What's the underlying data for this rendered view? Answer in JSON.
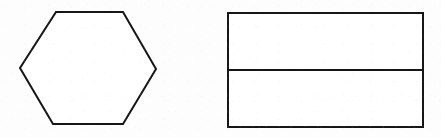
{
  "figure": {
    "title": "two-geometric-shapes-line-drawing",
    "canvas": {
      "width": 441,
      "height": 138
    },
    "background_color": "#fdfdfd",
    "stroke_color": "#161616",
    "fill_color": "#ffffff",
    "stroke_width": 2,
    "shapes": [
      {
        "name": "hexagon",
        "kind": "polygon",
        "sides": 6,
        "label": "",
        "points": "56,12 123,12 156,69 123,124 53,124 20,68",
        "bbox": {
          "x": 20,
          "y": 12,
          "width": 136,
          "height": 112
        }
      },
      {
        "name": "rectangle",
        "kind": "rect",
        "sides": 4,
        "label": "",
        "points": "228,13 423,13 423,127 228,127",
        "bbox": {
          "x": 228,
          "y": 13,
          "width": 195,
          "height": 114
        },
        "divider": {
          "name": "horizontal-divider",
          "orientation": "horizontal",
          "x1": 228,
          "y1": 70,
          "x2": 423,
          "y2": 70,
          "parts": 2
        }
      }
    ]
  }
}
